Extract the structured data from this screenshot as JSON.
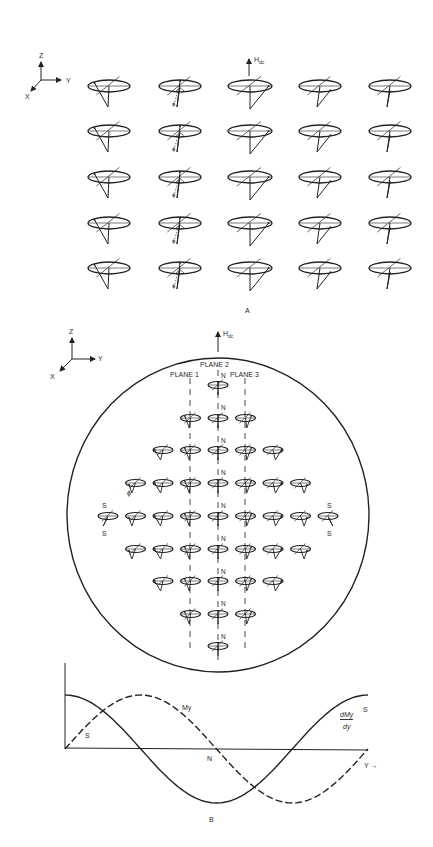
{
  "figure": {
    "panel_a": {
      "label": "A",
      "axes": {
        "z": "Z",
        "y": "Y",
        "x": "X"
      },
      "field_label": "H",
      "field_subscript": "dc",
      "phi_symbol": "ϕ",
      "grid_rows": 5,
      "grid_cols": 5
    },
    "panel_b": {
      "label": "B",
      "axes": {
        "z": "Z",
        "y": "Y",
        "x": "X"
      },
      "field_label": "H",
      "field_subscript": "dc",
      "plane_labels": [
        "PLANE 1",
        "PLANE 2",
        "PLANE 3"
      ],
      "node_label": "N",
      "edge_label": "S",
      "phi_symbol": "ϕ",
      "row_counts": [
        1,
        3,
        5,
        7,
        9,
        7,
        5,
        3,
        1
      ]
    },
    "graph": {
      "curve_solid_label_num": "dMy",
      "curve_solid_label_den": "dy",
      "curve_dashed_label": "My",
      "left_label": "S",
      "right_label": "S",
      "center_label": "N",
      "x_axis_label": "Y →"
    }
  },
  "chart_data": {
    "type": "line",
    "title": "",
    "xlabel": "Y",
    "ylabel": "",
    "grid": false,
    "series": [
      {
        "name": "My",
        "style": "dashed",
        "shape": "sine, one full period",
        "x": [
          0,
          0.25,
          0.5,
          0.75,
          1.0
        ],
        "values": [
          0,
          1,
          0,
          -1,
          0
        ]
      },
      {
        "name": "dMy/dy",
        "style": "solid",
        "shape": "cosine, one full period",
        "x": [
          0,
          0.25,
          0.5,
          0.75,
          1.0
        ],
        "values": [
          1,
          0,
          -1,
          0,
          1
        ]
      }
    ],
    "annotations": [
      "S (at Y=0)",
      "N (at Y=0.5)",
      "S (at Y=1)"
    ]
  }
}
